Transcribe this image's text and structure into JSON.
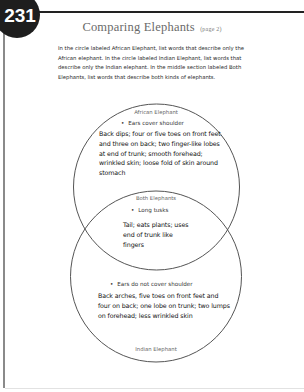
{
  "page": {
    "number": "231",
    "title": "Comparing Elephants",
    "title_suffix": "(page 2)"
  },
  "instructions": "In the circle labeled African Elephant, list words that describe only the African elephant. In the circle labeled Indian Elephant, list words that describe only the Indian elephant. In the middle section labeled Both Elephants, list words that describe both kinds of elephants.",
  "venn": {
    "african": {
      "label": "African Elephant",
      "bullet_mark": "•",
      "bullet": "Ears cover shoulder",
      "answer": "Back dips; four or five toes on front feet and three on back; two finger-like lobes at end of trunk; smooth forehead; wrinkled skin; loose fold of skin around stomach"
    },
    "both": {
      "label": "Both Elephants",
      "bullet_mark": "•",
      "bullet": "Long tusks",
      "answer": "Tail; eats plants; uses end of trunk like fingers"
    },
    "indian": {
      "label": "Indian Elephant",
      "bullet_mark": "•",
      "bullet": "Ears do not cover shoulder",
      "answer": "Back arches, five toes on front feet and four on back; one lobe on trunk; two lumps on forehead; less wrinkled skin"
    },
    "colors": {
      "circle_stroke": "#555555",
      "badge": "#1e1e1e",
      "title": "#6a6a6a"
    }
  }
}
